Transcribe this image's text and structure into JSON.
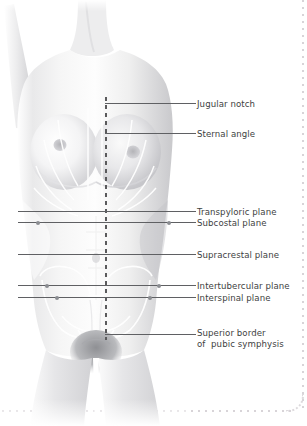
{
  "figure": {
    "style": "grayscale anatomical illustration",
    "colors": {
      "leader_line": "#5f6063",
      "midline": "#5a5a5c",
      "marker_dot": "#8b8d92",
      "label_text": "#3e3f42",
      "frame_dots": "#d8d4d8",
      "background": "#ffffff"
    }
  },
  "midline": {
    "name": "median plane",
    "style": "dashed vertical",
    "x": 105,
    "top": 97,
    "bottom": 340
  },
  "labels": [
    {
      "id": "jugular-notch",
      "text": "Jugular notch",
      "y": 99,
      "leader_y": 103,
      "leader_x1": 105,
      "leader_x2": 196,
      "full_width": false,
      "dots": []
    },
    {
      "id": "sternal-angle",
      "text": "Sternal angle",
      "y": 129,
      "leader_y": 133,
      "leader_x1": 105,
      "leader_x2": 196,
      "full_width": false,
      "dots": []
    },
    {
      "id": "transpyloric",
      "text": "Transpyloric plane",
      "y": 207,
      "leader_y": 211,
      "leader_x1": 18,
      "leader_x2": 196,
      "full_width": true,
      "dots": []
    },
    {
      "id": "subcostal",
      "text": "Subcostal plane",
      "y": 218,
      "leader_y": 222,
      "leader_x1": 18,
      "leader_x2": 196,
      "full_width": true,
      "dots": [
        38,
        169
      ]
    },
    {
      "id": "supracrestal",
      "text": "Supracrestal plane",
      "y": 250,
      "leader_y": 254,
      "leader_x1": 18,
      "leader_x2": 196,
      "full_width": true,
      "dots": []
    },
    {
      "id": "intertubercular",
      "text": "Intertubercular plane",
      "y": 281,
      "leader_y": 285,
      "leader_x1": 18,
      "leader_x2": 196,
      "full_width": true,
      "dots": [
        47,
        159
      ]
    },
    {
      "id": "interspinal",
      "text": "Interspinal plane",
      "y": 293,
      "leader_y": 297,
      "leader_x1": 18,
      "leader_x2": 196,
      "full_width": true,
      "dots": [
        57,
        150
      ]
    }
  ],
  "label_pubic": {
    "id": "superior-border-pubic-symphysis",
    "line1": "Superior border",
    "line2": "of  pubic symphysis",
    "y": 328,
    "leader_y": 334,
    "leader_x1": 105,
    "leader_x2": 196
  }
}
